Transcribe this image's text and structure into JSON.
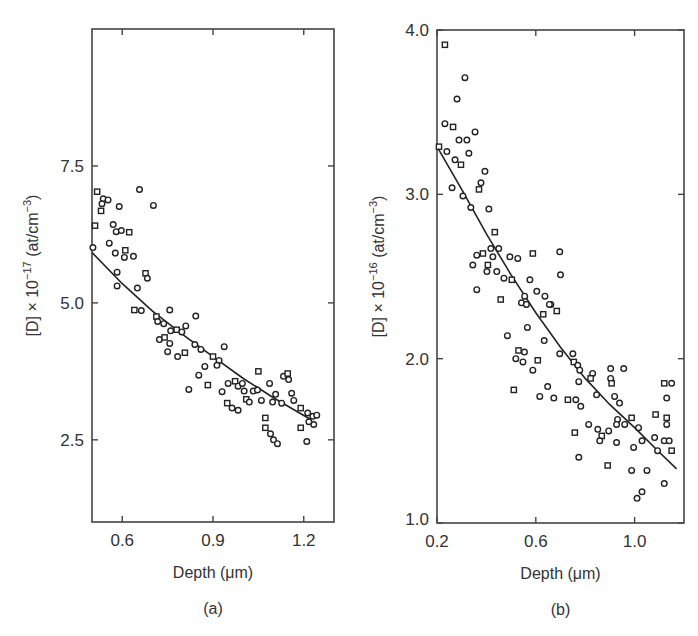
{
  "chart_data": [
    {
      "panel": "(a)",
      "type": "scatter",
      "title": "",
      "xlabel": "Depth (μm)",
      "ylabel": "[D] × 10^-17 (at/cm^-3)",
      "ylabel_parts": {
        "pre": "[D] × 10",
        "exp": "−17",
        "post": " (at/cm",
        "unit_exp": "−3",
        "close": ")"
      },
      "xlim": [
        0.5,
        1.3
      ],
      "ylim": [
        1.0,
        10.0
      ],
      "xticks": [
        0.6,
        0.9,
        1.2
      ],
      "xtick_labels": [
        "0.6",
        "0.9",
        "1.2"
      ],
      "yticks": [
        2.5,
        5.0,
        7.5
      ],
      "ytick_labels": [
        "2.5",
        "5.0",
        "7.5"
      ],
      "grid": false,
      "legend": null,
      "fit_line": {
        "x": [
          0.5,
          0.6,
          0.7,
          0.8,
          0.9,
          1.0,
          1.1,
          1.22
        ],
        "y": [
          5.92,
          5.35,
          4.85,
          4.42,
          4.02,
          3.62,
          3.27,
          2.88
        ]
      },
      "points": {
        "x": [
          0.517,
          0.537,
          0.553,
          0.533,
          0.53,
          0.657,
          0.703,
          0.59,
          0.51,
          0.57,
          0.58,
          0.597,
          0.623,
          0.503,
          0.557,
          0.577,
          0.61,
          0.607,
          0.637,
          0.583,
          0.677,
          0.683,
          0.583,
          0.65,
          0.64,
          0.663,
          0.757,
          0.843,
          0.713,
          0.717,
          0.737,
          0.76,
          0.78,
          0.797,
          0.81,
          0.723,
          0.74,
          0.757,
          0.75,
          0.783,
          0.807,
          0.84,
          0.86,
          0.937,
          0.9,
          0.92,
          0.873,
          0.853,
          0.883,
          0.82,
          0.913,
          0.93,
          0.947,
          0.963,
          0.983,
          0.95,
          0.973,
          0.983,
          1.003,
          0.997,
          1.01,
          1.02,
          1.033,
          1.047,
          1.05,
          1.087,
          1.133,
          1.06,
          1.073,
          1.097,
          1.107,
          1.127,
          1.147,
          1.15,
          1.16,
          1.167,
          1.073,
          1.09,
          1.1,
          1.113,
          1.19,
          1.213,
          1.23,
          1.233,
          1.19,
          1.21,
          1.217,
          1.243
        ],
        "y": [
          7.03,
          6.9,
          6.88,
          6.81,
          6.68,
          7.07,
          6.78,
          6.76,
          6.41,
          6.43,
          6.3,
          6.32,
          6.29,
          6.01,
          6.09,
          5.91,
          5.96,
          5.83,
          5.85,
          5.56,
          5.54,
          5.45,
          5.31,
          5.27,
          4.87,
          4.86,
          4.87,
          4.76,
          4.75,
          4.66,
          4.62,
          4.49,
          4.51,
          4.47,
          4.58,
          4.33,
          4.37,
          4.26,
          4.11,
          4.02,
          4.09,
          4.24,
          4.15,
          4.2,
          4.02,
          3.95,
          3.84,
          3.68,
          3.5,
          3.42,
          3.86,
          3.38,
          3.17,
          3.08,
          3.04,
          3.53,
          3.57,
          3.48,
          3.39,
          3.53,
          3.24,
          3.19,
          3.39,
          3.41,
          3.75,
          3.53,
          3.66,
          3.22,
          2.9,
          3.19,
          3.33,
          3.17,
          3.71,
          3.6,
          3.35,
          3.22,
          2.72,
          2.61,
          2.5,
          2.43,
          3.08,
          2.99,
          2.93,
          2.78,
          2.72,
          2.47,
          2.83,
          2.95
        ]
      }
    },
    {
      "panel": "(b)",
      "type": "scatter",
      "title": "",
      "xlabel": "Depth (μm)",
      "ylabel": "[D] × 10^-16 (at/cm^-3)",
      "ylabel_parts": {
        "pre": "[D] × 10",
        "exp": "−16",
        "post": " (at/cm",
        "unit_exp": "−3",
        "close": ")"
      },
      "xlim": [
        0.2,
        1.2
      ],
      "ylim": [
        1.0,
        4.0
      ],
      "xticks": [
        0.2,
        0.6,
        1.0
      ],
      "xtick_labels": [
        "0.2",
        "0.6",
        "1.0"
      ],
      "yticks": [
        1.0,
        2.0,
        3.0,
        4.0
      ],
      "ytick_labels": [
        "1.0",
        "2.0",
        "3.0",
        "4.0"
      ],
      "grid": false,
      "legend": null,
      "fit_line": {
        "x": [
          0.2,
          0.3,
          0.4,
          0.5,
          0.6,
          0.7,
          0.8,
          0.9,
          1.0,
          1.1,
          1.17
        ],
        "y": [
          3.29,
          3.03,
          2.76,
          2.51,
          2.28,
          2.07,
          1.88,
          1.72,
          1.58,
          1.43,
          1.33
        ]
      },
      "points": {
        "x": [
          0.232,
          0.313,
          0.281,
          0.232,
          0.265,
          0.354,
          0.289,
          0.321,
          0.208,
          0.24,
          0.329,
          0.273,
          0.297,
          0.394,
          0.378,
          0.261,
          0.37,
          0.305,
          0.337,
          0.41,
          0.434,
          0.418,
          0.45,
          0.361,
          0.386,
          0.426,
          0.495,
          0.527,
          0.588,
          0.697,
          0.7,
          0.345,
          0.406,
          0.442,
          0.402,
          0.471,
          0.503,
          0.576,
          0.604,
          0.361,
          0.458,
          0.555,
          0.637,
          0.661,
          0.685,
          0.542,
          0.562,
          0.655,
          0.63,
          0.566,
          0.485,
          0.634,
          0.53,
          0.554,
          0.519,
          0.548,
          0.608,
          0.588,
          0.697,
          0.75,
          0.754,
          0.77,
          0.778,
          0.774,
          0.511,
          0.648,
          0.616,
          0.673,
          0.73,
          0.762,
          0.782,
          0.83,
          0.822,
          0.903,
          0.956,
          0.903,
          0.907,
          0.846,
          0.919,
          0.939,
          1.12,
          1.15,
          1.13,
          0.814,
          0.758,
          0.851,
          0.895,
          0.931,
          0.988,
          0.927,
          0.96,
          1.016,
          0.867,
          0.859,
          0.927,
          1.03,
          1.085,
          1.081,
          1.12,
          0.996,
          1.13,
          1.13,
          1.093,
          0.774,
          0.891,
          0.988,
          1.05,
          1.14,
          1.15,
          1.03,
          1.01,
          1.12
        ],
        "y": [
          3.91,
          3.71,
          3.58,
          3.43,
          3.41,
          3.38,
          3.33,
          3.33,
          3.29,
          3.26,
          3.25,
          3.21,
          3.18,
          3.14,
          3.07,
          3.04,
          3.03,
          2.99,
          2.92,
          2.91,
          2.77,
          2.67,
          2.67,
          2.63,
          2.64,
          2.62,
          2.62,
          2.61,
          2.64,
          2.65,
          2.51,
          2.57,
          2.57,
          2.53,
          2.53,
          2.49,
          2.48,
          2.48,
          2.41,
          2.42,
          2.36,
          2.38,
          2.38,
          2.33,
          2.29,
          2.34,
          2.33,
          2.33,
          2.27,
          2.19,
          2.14,
          2.11,
          2.05,
          2.04,
          2.0,
          1.98,
          1.99,
          1.93,
          2.03,
          2.03,
          1.98,
          1.96,
          1.93,
          1.86,
          1.81,
          1.83,
          1.77,
          1.76,
          1.75,
          1.75,
          1.71,
          1.91,
          1.88,
          1.94,
          1.94,
          1.88,
          1.85,
          1.78,
          1.77,
          1.73,
          1.85,
          1.85,
          1.76,
          1.6,
          1.55,
          1.57,
          1.56,
          1.63,
          1.64,
          1.6,
          1.6,
          1.58,
          1.53,
          1.5,
          1.49,
          1.5,
          1.66,
          1.52,
          1.5,
          1.46,
          1.64,
          1.6,
          1.44,
          1.4,
          1.35,
          1.32,
          1.32,
          1.5,
          1.44,
          1.19,
          1.15,
          1.24
        ]
      }
    }
  ],
  "panels": [
    {
      "label": "(a)",
      "xlabel": "Depth (μm)"
    },
    {
      "label": "(b)",
      "xlabel": "Depth (μm)"
    }
  ]
}
